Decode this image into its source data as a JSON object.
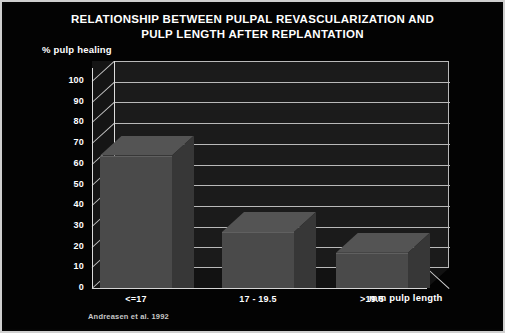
{
  "chart_data": {
    "type": "bar",
    "title": "RELATIONSHIP BETWEEN PULPAL REVASCULARIZATION AND PULP LENGTH AFTER REPLANTATION",
    "title_line1": "RELATIONSHIP BETWEEN PULPAL REVASCULARIZATION AND",
    "title_line2": "PULP LENGTH AFTER REPLANTATION",
    "ylabel": "% pulp healing",
    "xlabel": "mm pulp length",
    "categories": [
      "<=17",
      "17 - 19.5",
      ">19.5"
    ],
    "values": [
      64,
      27,
      17
    ],
    "ylim": [
      0,
      100
    ],
    "yticks": [
      "100",
      "90",
      "80",
      "70",
      "60",
      "50",
      "40",
      "30",
      "20",
      "10",
      "0"
    ],
    "grid": true,
    "legend": "none",
    "source": "Andreasen et al. 1992",
    "colors": {
      "background": "#030303",
      "bar_front": "#4a4a4a",
      "bar_side": "#373737",
      "bar_top": "#545454",
      "wall": "#1b1b1b",
      "gridline": "#b9b9b9",
      "text": "#ffffff",
      "frame": "#cfcfcf"
    }
  }
}
